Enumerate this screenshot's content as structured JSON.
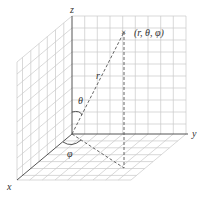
{
  "diagram": {
    "axes": {
      "x_label": "x",
      "y_label": "y",
      "z_label": "z"
    },
    "point": {
      "marker": "×",
      "label": "(r, θ, φ)"
    },
    "labels": {
      "radius": "r",
      "polar_angle": "θ",
      "azimuth_angle": "φ"
    },
    "colors": {
      "grid": "#c8c8c8",
      "axis": "#555555",
      "text": "#333333"
    }
  }
}
